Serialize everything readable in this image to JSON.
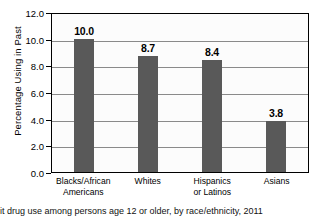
{
  "chart_data": {
    "type": "bar",
    "title": "",
    "xlabel": "",
    "ylabel": "Percentage Using in Past",
    "ylim": [
      0.0,
      12.0
    ],
    "ytick_values": [
      0.0,
      2.0,
      4.0,
      6.0,
      8.0,
      10.0,
      12.0
    ],
    "ytick_labels": [
      "0.0",
      "2.0",
      "4.0",
      "6.0",
      "8.0",
      "10.0",
      "12.0"
    ],
    "grid": true,
    "legend": "none",
    "categories": [
      "Blacks/African Americans",
      "Whites",
      "Hispanics or Latinos",
      "Asians"
    ],
    "category_lines": [
      [
        "Blacks/African",
        "Americans"
      ],
      [
        "Whites"
      ],
      [
        "Hispanics",
        "or Latinos"
      ],
      [
        "Asians"
      ]
    ],
    "values": [
      10.0,
      8.7,
      8.4,
      3.8
    ],
    "value_labels": [
      "10.0",
      "8.7",
      "8.4",
      "3.8"
    ],
    "bar_color": "#595959",
    "gridline_color": "#8a8a8a",
    "axis_color": "#000000",
    "plot_background": "#fcfcfc"
  },
  "caption": {
    "text": "it drug use among persons age 12 or older, by race/ethnicity, 2011"
  }
}
